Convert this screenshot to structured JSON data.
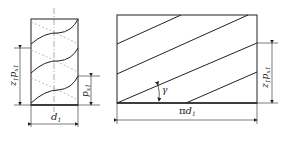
{
  "figure": {
    "left_view": {
      "description": "worm cylinder with helical threads",
      "label_height": "z1 px1",
      "label_height_main": "z",
      "label_height_sub1": "1",
      "label_height_p": "p",
      "label_height_sub2": "x1",
      "label_pitch_main": "p",
      "label_pitch_sub": "x1",
      "label_diameter_main": "d",
      "label_diameter_sub": "1"
    },
    "right_view": {
      "description": "developed helix (unrolled)",
      "label_angle": "γ",
      "label_width_prefix": "π",
      "label_width_main": "d",
      "label_width_sub": "1",
      "label_height_main": "z",
      "label_height_sub1": "1",
      "label_height_p": "p",
      "label_height_sub2": "x1"
    },
    "colors": {
      "line": "#222222",
      "dashed": "#999999"
    }
  }
}
